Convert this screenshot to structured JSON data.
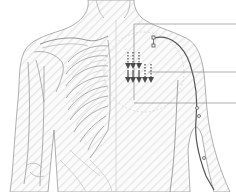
{
  "figure": {
    "left_half": "skeleton (clavicle, scapula, ribs, humerus)",
    "right_half": "skin surface with meridian path",
    "colors": {
      "outline": "#8a8a8a",
      "outline_light": "#bdbdbd",
      "meridian": "#555555",
      "arrows": "#4a4a4a",
      "leader": "#8c8c8c",
      "hatch": "#e4e4e4",
      "background": "#ffffff"
    },
    "arrow_groups": [
      {
        "name": "upper-arrows",
        "count": 3,
        "direction": "down"
      },
      {
        "name": "lower-arrows",
        "count": 5,
        "direction": "down"
      }
    ],
    "leader_lines": 3,
    "meridian_points": 4
  }
}
